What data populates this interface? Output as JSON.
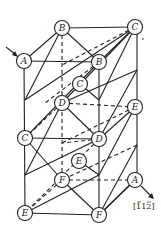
{
  "diagram": {
    "title": "",
    "direction_label": "[ī12̄]",
    "direction_label_text": "[112]",
    "direction_label_overbars": [
      0,
      2
    ],
    "atoms": [
      {
        "id": "B-top",
        "label": "B",
        "x": 62,
        "y": 28
      },
      {
        "id": "C-top",
        "label": "C",
        "x": 135,
        "y": 27
      },
      {
        "id": "A-left",
        "label": "A",
        "x": 24,
        "y": 61
      },
      {
        "id": "B-front",
        "label": "B",
        "x": 99,
        "y": 62
      },
      {
        "id": "C-mid",
        "label": "C",
        "x": 80,
        "y": 84
      },
      {
        "id": "D-back",
        "label": "D",
        "x": 62,
        "y": 103
      },
      {
        "id": "E-right",
        "label": "E",
        "x": 135,
        "y": 107
      },
      {
        "id": "C-left",
        "label": "C",
        "x": 25,
        "y": 138
      },
      {
        "id": "D-front",
        "label": "D",
        "x": 99,
        "y": 139
      },
      {
        "id": "E-mid",
        "label": "E",
        "x": 79,
        "y": 161
      },
      {
        "id": "F-back",
        "label": "F",
        "x": 62,
        "y": 180
      },
      {
        "id": "A-right",
        "label": "A",
        "x": 135,
        "y": 180
      },
      {
        "id": "E-bottom",
        "label": "E",
        "x": 25,
        "y": 213
      },
      {
        "id": "F-bottom",
        "label": "F",
        "x": 99,
        "y": 215
      }
    ]
  }
}
